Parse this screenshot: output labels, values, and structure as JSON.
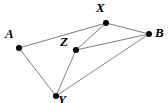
{
  "figure": {
    "type": "graph-diagram",
    "width": 168,
    "height": 103,
    "background_color": "#ffffff",
    "edge_color": "#808080",
    "edge_width": 1,
    "vertex_color": "#000000",
    "vertex_radius": 3,
    "label_color": "#000000"
  },
  "vertices": [
    {
      "id": "A",
      "label": "A",
      "x": 19,
      "y": 48,
      "label_x": 5,
      "label_y": 27
    },
    {
      "id": "X",
      "label": "X",
      "x": 106,
      "y": 23,
      "label_x": 96,
      "label_y": 1
    },
    {
      "id": "B",
      "label": "B",
      "x": 149,
      "y": 34,
      "label_x": 155,
      "label_y": 26
    },
    {
      "id": "Z",
      "label": "Z",
      "x": 76,
      "y": 50,
      "label_x": 60,
      "label_y": 35
    },
    {
      "id": "Y",
      "label": "Y",
      "x": 56,
      "y": 96,
      "label_x": 58,
      "label_y": 93
    }
  ],
  "edges": [
    {
      "from": "A",
      "to": "X",
      "x1": 19,
      "y1": 48,
      "x2": 106,
      "y2": 23
    },
    {
      "from": "A",
      "to": "Y",
      "x1": 19,
      "y1": 48,
      "x2": 56,
      "y2": 96
    },
    {
      "from": "X",
      "to": "Z",
      "x1": 106,
      "y1": 23,
      "x2": 76,
      "y2": 50
    },
    {
      "from": "X",
      "to": "B",
      "x1": 106,
      "y1": 23,
      "x2": 149,
      "y2": 34
    },
    {
      "from": "Z",
      "to": "B",
      "x1": 76,
      "y1": 50,
      "x2": 149,
      "y2": 34
    },
    {
      "from": "Z",
      "to": "Y",
      "x1": 76,
      "y1": 50,
      "x2": 56,
      "y2": 96
    },
    {
      "from": "Y",
      "to": "B",
      "x1": 56,
      "y1": 96,
      "x2": 149,
      "y2": 34
    }
  ]
}
